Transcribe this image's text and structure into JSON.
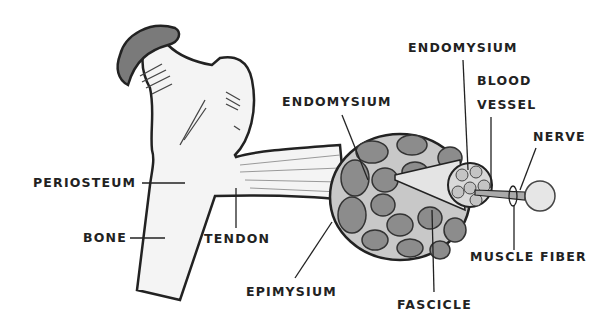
{
  "diagram": {
    "labels": {
      "periosteum": "PERIOSTEUM",
      "bone": "BONE",
      "tendon": "TENDON",
      "epimysium": "EPIMYSIUM",
      "endomysium_left": "ENDOMYSIUM",
      "endomysium_top": "ENDOMYSIUM",
      "blood_vessel_line1": "BLOOD",
      "blood_vessel_line2": "VESSEL",
      "nerve": "NERVE",
      "muscle_fiber": "MUSCLE FIBER",
      "fascicle": "FASCICLE"
    },
    "colors": {
      "outline": "#222222",
      "bone_fill": "#f4f4f4",
      "cartilage_fill": "#7a7a7a",
      "fascicle_fill": "#8c8c8c",
      "muscle_bg": "#c8c8c8",
      "fiber_fill": "#d9d9d9"
    }
  }
}
